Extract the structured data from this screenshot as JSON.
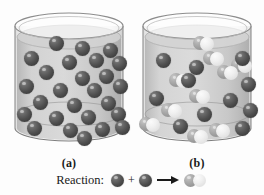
{
  "figure": {
    "type": "chemistry-reaction-diagram",
    "panels": [
      {
        "id": "a",
        "label": "(a)",
        "caption_role": "before-reaction",
        "contents": {
          "dark_reactant_count": 26,
          "product_molecule_count": 0
        },
        "molecules": [
          {
            "kind": "dark",
            "x": 46,
            "y": 33,
            "r": 7.5
          },
          {
            "kind": "dark",
            "x": 72,
            "y": 38,
            "r": 7.5
          },
          {
            "kind": "dark",
            "x": 100,
            "y": 40,
            "r": 7.5
          },
          {
            "kind": "dark",
            "x": 21,
            "y": 48,
            "r": 7.5
          },
          {
            "kind": "dark",
            "x": 59,
            "y": 52,
            "r": 7.5
          },
          {
            "kind": "dark",
            "x": 86,
            "y": 50,
            "r": 7.5
          },
          {
            "kind": "dark",
            "x": 109,
            "y": 53,
            "r": 7.5
          },
          {
            "kind": "dark",
            "x": 36,
            "y": 62,
            "r": 7.5
          },
          {
            "kind": "dark",
            "x": 72,
            "y": 68,
            "r": 7.5
          },
          {
            "kind": "dark",
            "x": 96,
            "y": 66,
            "r": 7.5
          },
          {
            "kind": "dark",
            "x": 16,
            "y": 76,
            "r": 7.5
          },
          {
            "kind": "dark",
            "x": 50,
            "y": 80,
            "r": 7.5
          },
          {
            "kind": "dark",
            "x": 84,
            "y": 80,
            "r": 7.5
          },
          {
            "kind": "dark",
            "x": 110,
            "y": 76,
            "r": 7.5
          },
          {
            "kind": "dark",
            "x": 30,
            "y": 92,
            "r": 7.5
          },
          {
            "kind": "dark",
            "x": 64,
            "y": 95,
            "r": 7.5
          },
          {
            "kind": "dark",
            "x": 98,
            "y": 93,
            "r": 7.5
          },
          {
            "kind": "dark",
            "x": 14,
            "y": 104,
            "r": 7.5
          },
          {
            "kind": "dark",
            "x": 46,
            "y": 108,
            "r": 7.5
          },
          {
            "kind": "dark",
            "x": 78,
            "y": 107,
            "r": 7.5
          },
          {
            "kind": "dark",
            "x": 108,
            "y": 104,
            "r": 7.5
          },
          {
            "kind": "dark",
            "x": 24,
            "y": 118,
            "r": 7.5
          },
          {
            "kind": "dark",
            "x": 60,
            "y": 120,
            "r": 7.5
          },
          {
            "kind": "dark",
            "x": 92,
            "y": 119,
            "r": 7.5
          },
          {
            "kind": "dark",
            "x": 112,
            "y": 117,
            "r": 7.5
          },
          {
            "kind": "dark",
            "x": 74,
            "y": 128,
            "r": 7.5
          }
        ]
      },
      {
        "id": "b",
        "label": "(b)",
        "caption_role": "after-reaction",
        "contents": {
          "dark_reactant_count": 12,
          "product_molecule_count": 9
        },
        "molecules": [
          {
            "kind": "product",
            "x": 62,
            "y": 33,
            "r": 7
          },
          {
            "kind": "dark",
            "x": 25,
            "y": 50,
            "r": 7.5
          },
          {
            "kind": "product",
            "x": 72,
            "y": 48,
            "r": 7
          },
          {
            "kind": "dark",
            "x": 58,
            "y": 57,
            "r": 7.5
          },
          {
            "kind": "product",
            "x": 100,
            "y": 55,
            "r": 7
          },
          {
            "kind": "dark",
            "x": 104,
            "y": 48,
            "r": 7.5
          },
          {
            "kind": "product",
            "x": 38,
            "y": 70,
            "r": 7
          },
          {
            "kind": "dark",
            "x": 50,
            "y": 70,
            "r": 7.5
          },
          {
            "kind": "dark",
            "x": 110,
            "y": 74,
            "r": 7.5
          },
          {
            "kind": "product",
            "x": 86,
            "y": 62,
            "r": 7
          },
          {
            "kind": "dark",
            "x": 18,
            "y": 88,
            "r": 7.5
          },
          {
            "kind": "product",
            "x": 58,
            "y": 86,
            "r": 7
          },
          {
            "kind": "dark",
            "x": 92,
            "y": 90,
            "r": 7.5
          },
          {
            "kind": "product",
            "x": 30,
            "y": 100,
            "r": 7
          },
          {
            "kind": "dark",
            "x": 66,
            "y": 104,
            "r": 7.5
          },
          {
            "kind": "dark",
            "x": 112,
            "y": 100,
            "r": 7.5
          },
          {
            "kind": "product",
            "x": 8,
            "y": 114,
            "r": 7
          },
          {
            "kind": "dark",
            "x": 42,
            "y": 116,
            "r": 7.5
          },
          {
            "kind": "product",
            "x": 78,
            "y": 120,
            "r": 7
          },
          {
            "kind": "dark",
            "x": 104,
            "y": 118,
            "r": 7.5
          },
          {
            "kind": "product",
            "x": 56,
            "y": 126,
            "r": 7
          }
        ]
      }
    ]
  },
  "legend": {
    "label": "Reaction:",
    "plus": "+",
    "arrow": "→",
    "reactant_a": "dark-sphere",
    "reactant_b": "dark-sphere",
    "product": "pale-diatomic-molecule"
  },
  "colors": {
    "sphere_dark": "#4e4e4e",
    "sphere_mid": "#9a9a9a",
    "sphere_pale": "#ececec",
    "glass_outline": "#8d8d8d",
    "liquid": "#c6c6c6",
    "background": "#fdfdfd",
    "text": "#1a1a1a"
  }
}
